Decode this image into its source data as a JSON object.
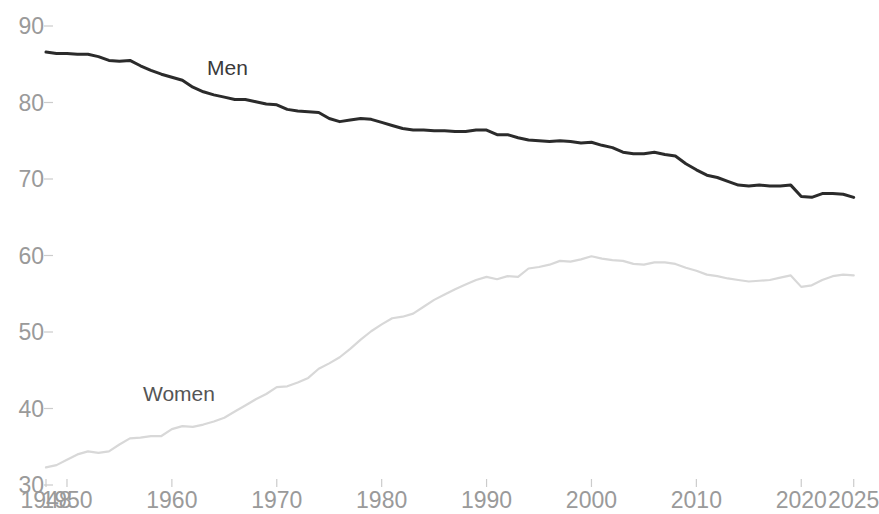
{
  "chart_data": {
    "type": "line",
    "title": "",
    "subtitle": "",
    "xlabel": "",
    "ylabel": "",
    "xlim": [
      1948,
      2025.6
    ],
    "ylim": [
      30,
      90
    ],
    "grid": false,
    "legend_position": "inline-annotation",
    "y_ticks": [
      30,
      40,
      50,
      60,
      70,
      80,
      90
    ],
    "y_tick_labels": [
      "30",
      "40",
      "50",
      "60",
      "70",
      "80",
      "90"
    ],
    "x_ticks": [
      1948,
      1950,
      1960,
      1970,
      1980,
      1990,
      2000,
      2010,
      2020,
      2025
    ],
    "x_tick_labels": [
      "1948",
      "1950",
      "1960",
      "1970",
      "1980",
      "1990",
      "2000",
      "2010",
      "2020",
      "2025"
    ],
    "annotations": [
      {
        "text": "Men",
        "x": 1964,
        "y": 83.5
      },
      {
        "text": "Women",
        "x": 1958,
        "y": 41.5
      }
    ],
    "series": [
      {
        "name": "Men",
        "label": "Men",
        "color": "#2b2b2b",
        "width": 3.0,
        "x": [
          1948,
          1949,
          1950,
          1951,
          1952,
          1953,
          1954,
          1955,
          1956,
          1957,
          1958,
          1959,
          1960,
          1961,
          1962,
          1963,
          1964,
          1965,
          1966,
          1967,
          1968,
          1969,
          1970,
          1971,
          1972,
          1973,
          1974,
          1975,
          1976,
          1977,
          1978,
          1979,
          1980,
          1981,
          1982,
          1983,
          1984,
          1985,
          1986,
          1987,
          1988,
          1989,
          1990,
          1991,
          1992,
          1993,
          1994,
          1995,
          1996,
          1997,
          1998,
          1999,
          2000,
          2001,
          2002,
          2003,
          2004,
          2005,
          2006,
          2007,
          2008,
          2009,
          2010,
          2011,
          2012,
          2013,
          2014,
          2015,
          2016,
          2017,
          2018,
          2019,
          2020,
          2021,
          2022,
          2023,
          2024,
          2025
        ],
        "y": [
          86.6,
          86.4,
          86.4,
          86.3,
          86.3,
          86.0,
          85.5,
          85.4,
          85.5,
          84.8,
          84.2,
          83.7,
          83.3,
          82.9,
          82.0,
          81.4,
          81.0,
          80.7,
          80.4,
          80.4,
          80.1,
          79.8,
          79.7,
          79.1,
          78.9,
          78.8,
          78.7,
          77.9,
          77.5,
          77.7,
          77.9,
          77.8,
          77.4,
          77.0,
          76.6,
          76.4,
          76.4,
          76.3,
          76.3,
          76.2,
          76.2,
          76.4,
          76.4,
          75.8,
          75.8,
          75.4,
          75.1,
          75.0,
          74.9,
          75.0,
          74.9,
          74.7,
          74.8,
          74.4,
          74.1,
          73.5,
          73.3,
          73.3,
          73.5,
          73.2,
          73.0,
          72.0,
          71.2,
          70.5,
          70.2,
          69.7,
          69.2,
          69.1,
          69.2,
          69.1,
          69.1,
          69.2,
          67.7,
          67.6,
          68.1,
          68.1,
          68.0,
          67.6
        ]
      },
      {
        "name": "Women",
        "label": "Women",
        "color": "#d8d8d8",
        "width": 2.2,
        "x": [
          1948,
          1949,
          1950,
          1951,
          1952,
          1953,
          1954,
          1955,
          1956,
          1957,
          1958,
          1959,
          1960,
          1961,
          1962,
          1963,
          1964,
          1965,
          1966,
          1967,
          1968,
          1969,
          1970,
          1971,
          1972,
          1973,
          1974,
          1975,
          1976,
          1977,
          1978,
          1979,
          1980,
          1981,
          1982,
          1983,
          1984,
          1985,
          1986,
          1987,
          1988,
          1989,
          1990,
          1991,
          1992,
          1993,
          1994,
          1995,
          1996,
          1997,
          1998,
          1999,
          2000,
          2001,
          2002,
          2003,
          2004,
          2005,
          2006,
          2007,
          2008,
          2009,
          2010,
          2011,
          2012,
          2013,
          2014,
          2015,
          2016,
          2017,
          2018,
          2019,
          2020,
          2021,
          2022,
          2023,
          2024,
          2025
        ],
        "y": [
          32.3,
          32.6,
          33.3,
          34.0,
          34.4,
          34.2,
          34.4,
          35.3,
          36.1,
          36.2,
          36.4,
          36.4,
          37.3,
          37.7,
          37.6,
          37.9,
          38.3,
          38.8,
          39.6,
          40.4,
          41.2,
          41.9,
          42.8,
          42.9,
          43.4,
          44.0,
          45.2,
          45.9,
          46.7,
          47.8,
          49.0,
          50.1,
          51.0,
          51.8,
          52.0,
          52.4,
          53.3,
          54.2,
          54.9,
          55.6,
          56.2,
          56.8,
          57.2,
          56.9,
          57.3,
          57.2,
          58.3,
          58.5,
          58.8,
          59.3,
          59.2,
          59.5,
          59.9,
          59.6,
          59.4,
          59.3,
          58.9,
          58.8,
          59.1,
          59.1,
          58.9,
          58.4,
          58.0,
          57.5,
          57.3,
          57.0,
          56.8,
          56.6,
          56.7,
          56.8,
          57.1,
          57.4,
          55.9,
          56.1,
          56.8,
          57.3,
          57.5,
          57.4
        ]
      }
    ]
  },
  "axis": {
    "tick_color": "#cccccc",
    "label_color": "#9a9a9a"
  }
}
